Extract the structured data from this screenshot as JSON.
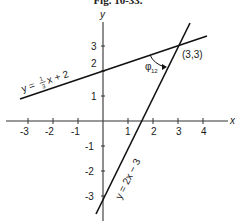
{
  "figure": {
    "title": "Fig. 10-33.",
    "axes": {
      "x_label": "x",
      "y_label": "y",
      "x_ticks": [
        "-3",
        "-2",
        "-1",
        "1",
        "2",
        "3",
        "4"
      ],
      "y_ticks": [
        "3",
        "2",
        "1",
        "-1",
        "-2",
        "-3"
      ]
    },
    "lines": [
      {
        "name": "line-1",
        "equation_prefix": "y = ",
        "equation_frac_num": "1",
        "equation_frac_den": "3",
        "equation_suffix": "x + 2"
      },
      {
        "name": "line-2",
        "equation": "y = 2x − 3"
      }
    ],
    "intersection": {
      "label": "(3,3)"
    },
    "angle": {
      "symbol": "φ",
      "subscript": "12"
    }
  }
}
